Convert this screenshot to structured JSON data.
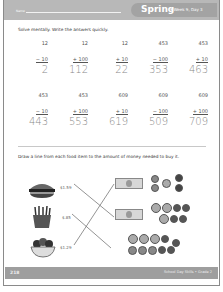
{
  "header": {
    "name_label": "Name",
    "season": "Spring",
    "week_day": "• Week 9, Day 3"
  },
  "section1": {
    "instruction": "Solve mentally. Write the answers quickly.",
    "rows": [
      [
        {
          "top": "12",
          "op": "− 10",
          "answer": "2"
        },
        {
          "top": "12",
          "op": "+ 100",
          "answer": "112"
        },
        {
          "top": "12",
          "op": "+ 10",
          "answer": "22"
        },
        {
          "top": "453",
          "op": "− 100",
          "answer": "353"
        },
        {
          "top": "453",
          "op": "+ 10",
          "answer": "463"
        }
      ],
      [
        {
          "top": "453",
          "op": "− 10",
          "answer": "443"
        },
        {
          "top": "453",
          "op": "+ 100",
          "answer": "553"
        },
        {
          "top": "609",
          "op": "+ 10",
          "answer": "619"
        },
        {
          "top": "609",
          "op": "− 100",
          "answer": "509"
        },
        {
          "top": "609",
          "op": "+ 100",
          "answer": "709"
        }
      ]
    ]
  },
  "section2": {
    "instruction": "Draw a line from each food item to the amount of money needed to buy it.",
    "foods": [
      {
        "icon": "hamburger-icon",
        "price": "$1.59"
      },
      {
        "icon": "french-fries-icon",
        "price": "$.85"
      },
      {
        "icon": "salad-bowl-icon",
        "price": "$1.29"
      }
    ],
    "money_groups": [
      {
        "bills": 1,
        "coins": 5
      },
      {
        "bills": 1,
        "coins": 7
      },
      {
        "bills": 0,
        "coins": 10
      }
    ]
  },
  "footer": {
    "page_number": "218",
    "series": "School Day Skills • Grade 2"
  },
  "colors": {
    "header_bg": "#b8b8b8",
    "pill_bg": "#a3a3a3",
    "footer_bg": "#9e9e9e"
  }
}
